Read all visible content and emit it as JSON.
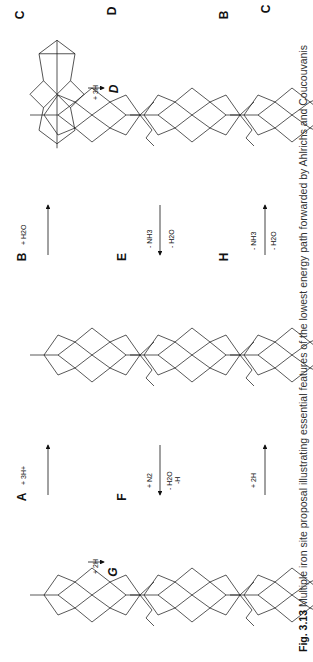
{
  "figure": {
    "caption_label": "Fig. 3.13",
    "caption_text": "Multiple iron site proposal illustrating essential features of the lowest energy path forwarded by Ahlrichs and Coucouvanis",
    "orientation": "rotated 90° (text reads bottom-to-top)"
  },
  "panels": [
    {
      "id": "A",
      "row": 3,
      "col": 1,
      "ligands": {
        "top": "S(Cys275)",
        "bottom": "(His215)N",
        "center": "N",
        "mo": "Mo",
        "extra": []
      }
    },
    {
      "id": "B",
      "row": 3,
      "col": 2,
      "ligands": {
        "top": "S(Cys275)",
        "bottom": "(His215)N",
        "center": "N",
        "mo": "Mo",
        "extra": [
          "SH",
          "SH",
          "SH"
        ]
      }
    },
    {
      "id": "C",
      "row": 3,
      "col": 3,
      "ligands": {
        "top": "S(Cys275)",
        "bottom": "(His215)N",
        "center": "N",
        "mo": "Mo",
        "extra": [
          "OH2",
          "SH",
          "SH",
          "SH"
        ]
      }
    },
    {
      "id": "D",
      "row": 2,
      "col": 3,
      "ligands": {
        "top": "S(Cys275)",
        "bottom": "(His215)N",
        "center": "NH3",
        "mo": "Mo",
        "extra": [
          "H2O",
          "SH",
          "SH",
          "SH"
        ]
      }
    },
    {
      "id": "E",
      "row": 2,
      "col": 2,
      "ligands": {
        "top": "S(Cys275)",
        "bottom": "(His215)N",
        "center": "",
        "mo": "Mo",
        "extra": [
          "SH",
          "SH",
          "SH"
        ]
      }
    },
    {
      "id": "F",
      "row": 2,
      "col": 1,
      "ligands": {
        "top": "S(Cys275)",
        "bottom": "(His215)N",
        "center": "N",
        "mo": "Mo",
        "extra": [
          "H2O",
          "SH",
          "N",
          "SH"
        ]
      }
    },
    {
      "id": "G",
      "row": 1,
      "col": 1,
      "ligands": {
        "top": "S(Cys275)",
        "bottom": "(His215)N",
        "center": "N",
        "mo": "Mo",
        "extra": [
          "H2O",
          "SH",
          "NH2",
          "SH"
        ]
      }
    },
    {
      "id": "H",
      "row": 1,
      "col": 2,
      "ligands": {
        "top": "S(Cys275)",
        "bottom": "(His215)N",
        "center": "N",
        "mo": "Mo",
        "extra": [
          "H2O",
          "SH",
          "NH2",
          "SH",
          "SH"
        ]
      }
    },
    {
      "id": "B",
      "row": 1,
      "col": 3,
      "ligands": {
        "top": "S(Cys275)",
        "bottom": "(His215)N",
        "center": "N",
        "mo": "Mo",
        "extra": [
          "SH",
          "SH",
          "SH"
        ]
      }
    }
  ],
  "arrows": [
    {
      "from": "A",
      "to": "B",
      "labels": [
        "+ 3H+"
      ]
    },
    {
      "from": "B",
      "to": "C",
      "labels": [
        "+ H2O"
      ]
    },
    {
      "from": "C",
      "to": "D",
      "labels": [
        "+ 3H"
      ]
    },
    {
      "from": "D",
      "to": "E",
      "labels": [
        "- NH3",
        "- H2O"
      ]
    },
    {
      "from": "E",
      "to": "F",
      "labels": [
        "+ N2",
        "- H2O",
        "-H"
      ]
    },
    {
      "from": "F",
      "to": "G",
      "labels": [
        "+ 2H"
      ]
    },
    {
      "from": "G",
      "to": "H",
      "labels": [
        "+ 2H"
      ]
    },
    {
      "from": "H",
      "to": "B",
      "labels": [
        "- NH3",
        "- H2O"
      ]
    }
  ],
  "text": {
    "cys": "S(Cys275)",
    "his": "(His215)N",
    "mo": "Mo",
    "fe": "Fe",
    "s": "S",
    "homocitrate": [
      "R",
      "R'",
      "O"
    ]
  }
}
